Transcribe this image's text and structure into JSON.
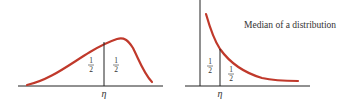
{
  "caption": "Median of a distribution",
  "colors": {
    "curve": "#c0392b",
    "axis": "#222222",
    "text": "#333333"
  },
  "left_plot": {
    "median_label": "η",
    "area_left": {
      "num": "1",
      "den": "2"
    },
    "area_right": {
      "num": "1",
      "den": "2"
    }
  },
  "right_plot": {
    "median_label": "η",
    "area_left": {
      "num": "1",
      "den": "2"
    },
    "area_right": {
      "num": "1",
      "den": "2"
    }
  }
}
